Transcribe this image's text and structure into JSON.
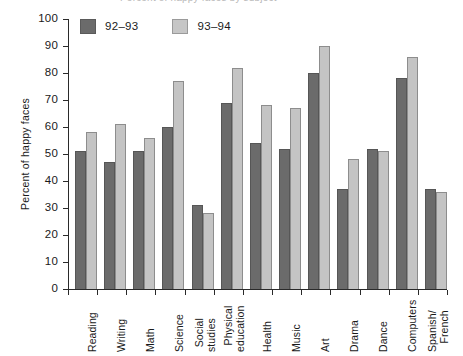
{
  "chart_data": {
    "type": "bar",
    "title": "Percent of happy faces by subject",
    "xlabel": "",
    "ylabel": "Percent of happy faces",
    "ylim": [
      0,
      100
    ],
    "ytick_step": 10,
    "yticks": [
      100,
      90,
      80,
      70,
      60,
      50,
      40,
      30,
      20,
      10,
      0
    ],
    "grid": false,
    "legend_position": "top-left",
    "categories": [
      "Reading",
      "Writing",
      "Math",
      "Science",
      "Social\nstudies",
      "Physical\neducation",
      "Health",
      "Music",
      "Art",
      "Drama",
      "Dance",
      "Computers",
      "Spanish/\nFrench"
    ],
    "series": [
      {
        "name": "92–93",
        "color": "#6b6b6b",
        "values": [
          51,
          47,
          51,
          60,
          31,
          69,
          54,
          52,
          80,
          37,
          52,
          78,
          37
        ]
      },
      {
        "name": "93–94",
        "color": "#c4c4c4",
        "values": [
          58,
          61,
          56,
          77,
          28,
          82,
          68,
          67,
          90,
          48,
          51,
          86,
          36
        ]
      }
    ]
  },
  "legend": {
    "items": [
      {
        "label": "92–93",
        "swatch": "dark-gray-swatch"
      },
      {
        "label": "93–94",
        "swatch": "light-gray-swatch"
      }
    ]
  },
  "axes": {
    "y_title": "Percent of happy faces"
  }
}
